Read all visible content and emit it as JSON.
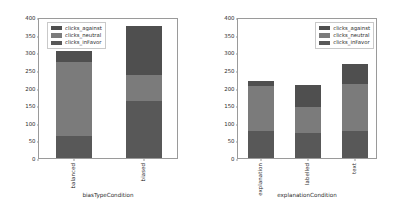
{
  "colors": {
    "clicks_against": "#4f4f4f",
    "clicks_neutral": "#7b7b7b",
    "clicks_inFavor": "#585858",
    "axis": "#9a9a9a",
    "text": "#2b2b2b",
    "background": "#ffffff"
  },
  "legend": {
    "entries": [
      {
        "label": "clicks_against",
        "color": "#4f4f4f"
      },
      {
        "label": "clicks_neutral",
        "color": "#7b7b7b"
      },
      {
        "label": "clicks_inFavor",
        "color": "#585858"
      }
    ]
  },
  "chart_data": [
    {
      "type": "bar",
      "stacked": true,
      "title": "",
      "xlabel": "biasTypeCondition",
      "ylabel": "",
      "categories": [
        "balanced",
        "biased"
      ],
      "yticks": [
        0,
        50,
        100,
        150,
        200,
        250,
        300,
        350,
        400
      ],
      "ylim": [
        0,
        400
      ],
      "grid": false,
      "legend_position": "upper left",
      "series": [
        {
          "name": "clicks_inFavor",
          "values": [
            62,
            161
          ]
        },
        {
          "name": "clicks_neutral",
          "values": [
            210,
            74
          ]
        },
        {
          "name": "clicks_against",
          "values": [
            31,
            140
          ]
        }
      ],
      "totals": [
        303,
        375
      ]
    },
    {
      "type": "bar",
      "stacked": true,
      "title": "",
      "xlabel": "explanationCondition",
      "ylabel": "",
      "categories": [
        "explanation",
        "labelled",
        "text"
      ],
      "yticks": [
        0,
        50,
        100,
        150,
        200,
        250,
        300,
        350,
        400
      ],
      "ylim": [
        0,
        400
      ],
      "grid": false,
      "legend_position": "upper right",
      "series": [
        {
          "name": "clicks_inFavor",
          "values": [
            76,
            72,
            77
          ]
        },
        {
          "name": "clicks_neutral",
          "values": [
            129,
            73,
            133
          ]
        },
        {
          "name": "clicks_against",
          "values": [
            13,
            62,
            58
          ]
        }
      ],
      "totals": [
        218,
        207,
        268
      ]
    }
  ]
}
